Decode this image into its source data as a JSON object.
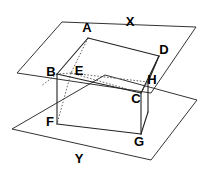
{
  "figure": {
    "background_color": "#ffffff",
    "stroke_color": "#222222",
    "hidden_stroke_color": "#555555",
    "label_color": "#000000",
    "planes": [
      {
        "name": "X",
        "label": "X",
        "label_x": 130,
        "label_y": 23,
        "points": "62,22 196,27 151,93 17,73",
        "style": "solid"
      },
      {
        "name": "Y",
        "label": "Y",
        "label_x": 79,
        "label_y": 160,
        "points": "105,75 197,100 151,160 12,129",
        "style": "solid"
      }
    ],
    "vertices": [
      {
        "name": "A",
        "label": "A",
        "x": 88,
        "y": 38,
        "label_x": 87,
        "label_y": 29,
        "visible": true
      },
      {
        "name": "B",
        "label": "B",
        "x": 57,
        "y": 74,
        "label_x": 51,
        "label_y": 73,
        "visible": true
      },
      {
        "name": "C",
        "label": "C",
        "x": 141,
        "y": 93,
        "label_x": 136,
        "label_y": 100,
        "visible": true
      },
      {
        "name": "D",
        "label": "D",
        "x": 159,
        "y": 56,
        "label_x": 164,
        "label_y": 51,
        "visible": true
      },
      {
        "name": "E",
        "label": "E",
        "x": 71,
        "y": 73,
        "label_x": 79,
        "label_y": 72,
        "visible": false
      },
      {
        "name": "F",
        "label": "F",
        "x": 57,
        "y": 124,
        "label_x": 50,
        "label_y": 123,
        "visible": true
      },
      {
        "name": "G",
        "label": "G",
        "x": 141,
        "y": 134,
        "label_x": 139,
        "label_y": 143,
        "visible": true
      },
      {
        "name": "H",
        "label": "H",
        "x": 148,
        "y": 82,
        "label_x": 152,
        "label_y": 81,
        "visible": true
      }
    ],
    "solid_edges": [
      {
        "from": "A",
        "to": "D"
      },
      {
        "from": "A",
        "to": "B"
      },
      {
        "from": "B",
        "to": "C"
      },
      {
        "from": "C",
        "to": "D"
      },
      {
        "from": "D",
        "to": "H"
      },
      {
        "from": "B",
        "to": "F"
      },
      {
        "from": "C",
        "to": "G"
      },
      {
        "from": "F",
        "to": "G"
      },
      {
        "from": "G",
        "to": "H"
      }
    ],
    "hidden_edges": [
      {
        "from": "A",
        "to": "E"
      },
      {
        "from": "E",
        "to": "B"
      },
      {
        "from": "E",
        "to": "C"
      },
      {
        "from": "E",
        "to": "H"
      },
      {
        "from": "E",
        "to": "F"
      },
      {
        "from": "H",
        "to": "C"
      }
    ]
  }
}
